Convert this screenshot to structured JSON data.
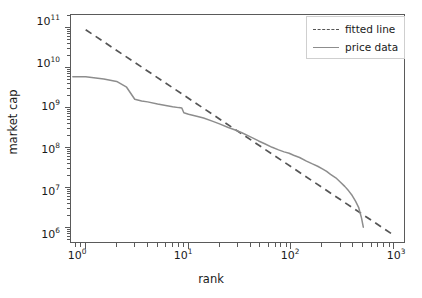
{
  "chart_data": {
    "type": "line",
    "title": "",
    "xlabel": "rank",
    "ylabel": "market cap",
    "xscale": "log",
    "yscale": "log",
    "xlim": [
      0.72,
      1300
    ],
    "ylim": [
      400000,
      210000000000
    ],
    "grid": false,
    "legend_position": "upper right",
    "xticklabels": [
      "10",
      "10",
      "10",
      "10"
    ],
    "xtick_exponents": [
      "0",
      "1",
      "2",
      "3"
    ],
    "xticks": [
      1,
      10,
      100,
      1000
    ],
    "yticklabels": [
      "10",
      "10",
      "10",
      "10",
      "10",
      "10"
    ],
    "ytick_exponents": [
      "6",
      "7",
      "8",
      "9",
      "10",
      "11"
    ],
    "yticks": [
      1000000,
      10000000,
      100000000,
      1000000000,
      10000000000,
      100000000000
    ],
    "series": [
      {
        "name": "fitted line",
        "style": "dashed",
        "color": "#555555",
        "x": [
          1,
          1000
        ],
        "y": [
          90000000000,
          650000
        ]
      },
      {
        "name": "price data",
        "style": "solid",
        "color": "#8d8d8d",
        "x": [
          0.75,
          1,
          1.5,
          2,
          2.5,
          3,
          3.5,
          4,
          5,
          6,
          7,
          8,
          8.6,
          9,
          10,
          12,
          14,
          17,
          20,
          24,
          28,
          33,
          40,
          48,
          55,
          65,
          75,
          85,
          95,
          105,
          120,
          140,
          160,
          180,
          200,
          220,
          240,
          270,
          300,
          330,
          360,
          390,
          420,
          450,
          480,
          500
        ],
        "y": [
          6000000000,
          6000000000,
          5300000000,
          4600000000,
          3300000000,
          1650000000,
          1500000000,
          1420000000,
          1250000000,
          1150000000,
          1070000000,
          1020000000,
          1000000000,
          760000000,
          700000000,
          620000000,
          560000000,
          470000000,
          400000000,
          330000000,
          285000000,
          240000000,
          190000000,
          150000000,
          128000000,
          104000000,
          90000000,
          80000000,
          74000000,
          66000000,
          58000000,
          47000000,
          40000000,
          35000000,
          30000000,
          26000000,
          22000000,
          18000000,
          14000000,
          11000000,
          8500000,
          6500000,
          4700000,
          3300000,
          1800000,
          1050000
        ]
      }
    ]
  },
  "legend": {
    "items": [
      {
        "label": "fitted line",
        "marker": "dashed-line-swatch"
      },
      {
        "label": "price data",
        "marker": "solid-line-swatch"
      }
    ]
  },
  "axes": {
    "x_title": "rank",
    "y_title": "market cap"
  }
}
